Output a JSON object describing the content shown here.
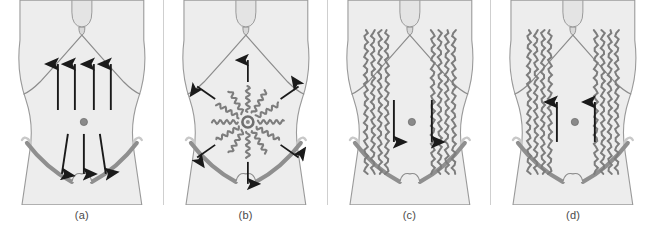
{
  "figure": {
    "panel_count": 4,
    "width": 655,
    "height": 234,
    "background_color": "#ffffff"
  },
  "colors": {
    "body_fill": "#ededed",
    "body_outline": "#9a9a9a",
    "rib_margin": "#8c8c8c",
    "ligament_gray": "#8f8f8f",
    "vein_gray": "#7d7d7d",
    "arrow_black": "#1a1a1a",
    "navel_gray": "#8a8a8a",
    "caption_color": "#4a4a4a",
    "divider_color": "#cfcfcf"
  },
  "panels": [
    {
      "id": "panel-a",
      "caption": "(a)",
      "pattern_name": "normal-drainage",
      "arrows_up": 4,
      "arrows_down": 3,
      "veins": "none",
      "arrow_up_x": [
        58,
        75,
        94,
        111
      ],
      "arrow_up_top": 62,
      "arrow_up_bottom": 110,
      "arrow_down_x": [
        68,
        84,
        100
      ],
      "arrow_down_top": 134,
      "arrow_down_bottom": 178,
      "arrow_down_spread": 9,
      "navel": {
        "cx": 84,
        "cy": 122,
        "r": 3.6
      }
    },
    {
      "id": "panel-b",
      "caption": "(b)",
      "pattern_name": "caput-medusae-radial",
      "spokes": 12,
      "arrows_radial": 6,
      "veins": "radial-wavy",
      "arrow_angles_deg": [
        0,
        55,
        125,
        180,
        235,
        305
      ],
      "spoke_inner_radius": 10,
      "spoke_outer_radius": 36,
      "arrow_inner_radius": 40,
      "arrow_outer_radius": 62,
      "navel": {
        "cx": 84,
        "cy": 122,
        "r": 5.5
      }
    },
    {
      "id": "panel-c",
      "caption": "(c)",
      "pattern_name": "inferior-vena-cava-obstruction",
      "arrows_down": 2,
      "arrows_up": 0,
      "veins": "lateral-vertical-wavy",
      "vein_bundle_left_x": [
        38,
        45,
        52,
        59
      ],
      "vein_bundle_right_x": [
        105,
        112,
        119,
        126
      ],
      "vein_top": 30,
      "vein_bottom": 174,
      "arrow_x": [
        62,
        108
      ],
      "arrow_top": 100,
      "arrow_bottom": 146,
      "navel": {
        "cx": 84,
        "cy": 122,
        "r": 3.6
      }
    },
    {
      "id": "panel-d",
      "caption": "(d)",
      "pattern_name": "superior-vena-cava-obstruction",
      "arrows_up": 2,
      "arrows_down": 0,
      "veins": "lateral-vertical-wavy",
      "vein_bundle_left_x": [
        38,
        45,
        52,
        59
      ],
      "vein_bundle_right_x": [
        105,
        112,
        119,
        126
      ],
      "vein_top": 30,
      "vein_bottom": 174,
      "arrow_x": [
        62,
        108
      ],
      "arrow_top": 100,
      "arrow_bottom": 146,
      "navel": {
        "cx": 84,
        "cy": 122,
        "r": 3.6
      }
    }
  ],
  "anatomy": {
    "torso_label": "anterior abdominal wall",
    "navel_label": "umbilicus",
    "costal_margin_label": "costal margin",
    "inguinal_ligament_label": "inguinal ligament",
    "xiphoid_label": "xiphoid process",
    "pubic_label": "pubic symphysis"
  }
}
